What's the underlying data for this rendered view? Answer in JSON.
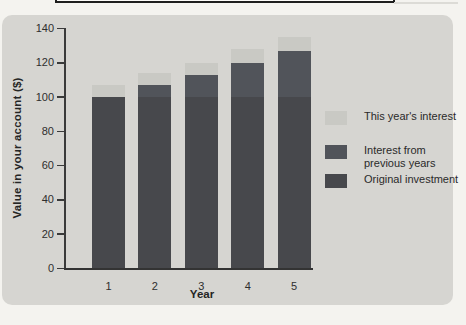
{
  "figure": {
    "page_bg": "#f4f3ef",
    "panel_bg": "#d6d5d1",
    "axis_color": "#3a3a3a",
    "rule_color": "#1e1e1e"
  },
  "chart_data": {
    "type": "bar",
    "stacked": true,
    "title": "",
    "xlabel": "Year",
    "ylabel": "Value in your account ($)",
    "categories": [
      "1",
      "2",
      "3",
      "4",
      "5"
    ],
    "series": [
      {
        "name": "Original investment",
        "color": "#47484c",
        "values": [
          100,
          100,
          100,
          100,
          100
        ]
      },
      {
        "name": "Interest from previous years",
        "color": "#51545a",
        "values": [
          0,
          7,
          13,
          20,
          27
        ]
      },
      {
        "name": "This year's interest",
        "color": "#c9c9c4",
        "values": [
          7,
          7,
          7,
          8,
          8
        ]
      }
    ],
    "totals": [
      107,
      114,
      120,
      128,
      135
    ],
    "ylim": [
      0,
      140
    ],
    "yticks": [
      0,
      20,
      40,
      60,
      80,
      100,
      120,
      140
    ],
    "grid": false,
    "legend_position": "right",
    "legend_order": [
      "This year's interest",
      "Interest from previous years",
      "Original investment"
    ]
  }
}
